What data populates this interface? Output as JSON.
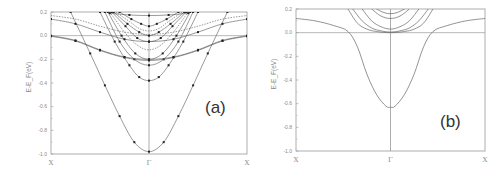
{
  "chart_data": [
    {
      "type": "line",
      "panel_label": "(a)",
      "title": "",
      "ylabel": "E-E_F(eV)",
      "xlabel": "",
      "x_ticks": [
        "X",
        "Γ",
        "X"
      ],
      "y_ticks": [
        "0.2",
        "0.0",
        "-0.2",
        "-0.4",
        "-0.6",
        "-0.8",
        "-1.0"
      ],
      "ylim": [
        -1.0,
        0.2
      ],
      "xlim": [
        -1,
        1
      ],
      "markers": true,
      "fermi_line": 0.0,
      "frame_px": {
        "x0": 51,
        "x1": 247,
        "yTop": 12,
        "yBot": 154
      },
      "series": [
        {
          "name": "deep parabola",
          "style": "markers",
          "x": [
            -0.8,
            -0.6,
            -0.45,
            -0.3,
            -0.15,
            0,
            0.15,
            0.3,
            0.45,
            0.6,
            0.8
          ],
          "y": [
            0.2,
            -0.15,
            -0.42,
            -0.68,
            -0.9,
            -0.98,
            -0.9,
            -0.68,
            -0.42,
            -0.15,
            0.2
          ]
        },
        {
          "name": "parabola -0.38",
          "style": "markers",
          "x": [
            -0.5,
            -0.35,
            -0.2,
            -0.1,
            0,
            0.1,
            0.2,
            0.35,
            0.5
          ],
          "y": [
            0.2,
            -0.05,
            -0.25,
            -0.35,
            -0.38,
            -0.35,
            -0.25,
            -0.05,
            0.2
          ]
        },
        {
          "name": "parabola -0.25",
          "style": "markers",
          "x": [
            -0.45,
            -0.3,
            -0.15,
            0,
            0.15,
            0.3,
            0.45
          ],
          "y": [
            0.2,
            -0.05,
            -0.2,
            -0.25,
            -0.2,
            -0.05,
            0.2
          ]
        },
        {
          "name": "parabola -0.2",
          "style": "markers",
          "x": [
            -0.42,
            -0.28,
            -0.14,
            0,
            0.14,
            0.28,
            0.42
          ],
          "y": [
            0.2,
            0.0,
            -0.15,
            -0.2,
            -0.15,
            0.0,
            0.2
          ]
        },
        {
          "name": "parabola -0.12",
          "style": "dashed",
          "x": [
            -0.4,
            -0.25,
            -0.12,
            0,
            0.12,
            0.25,
            0.4
          ],
          "y": [
            0.2,
            0.03,
            -0.08,
            -0.12,
            -0.08,
            0.03,
            0.2
          ]
        },
        {
          "name": "parabola -0.05",
          "style": "markers",
          "x": [
            -0.38,
            -0.24,
            -0.12,
            0,
            0.12,
            0.24,
            0.38
          ],
          "y": [
            0.2,
            0.08,
            -0.02,
            -0.05,
            -0.02,
            0.08,
            0.2
          ]
        },
        {
          "name": "parabola 0.0",
          "style": "markers",
          "x": [
            -0.36,
            -0.22,
            -0.1,
            0,
            0.1,
            0.22,
            0.36
          ],
          "y": [
            0.2,
            0.1,
            0.03,
            0.0,
            0.03,
            0.1,
            0.2
          ]
        },
        {
          "name": "parabola 0.04",
          "style": "dashed",
          "x": [
            -0.34,
            -0.2,
            -0.1,
            0,
            0.1,
            0.2,
            0.34
          ],
          "y": [
            0.2,
            0.12,
            0.06,
            0.04,
            0.06,
            0.12,
            0.2
          ]
        },
        {
          "name": "parabola 0.08",
          "style": "markers",
          "x": [
            -0.3,
            -0.18,
            -0.08,
            0,
            0.08,
            0.18,
            0.3
          ],
          "y": [
            0.2,
            0.14,
            0.1,
            0.08,
            0.1,
            0.14,
            0.2
          ]
        },
        {
          "name": "flat 0.17",
          "style": "markers",
          "x": [
            -0.4,
            -0.2,
            0,
            0.2,
            0.4
          ],
          "y": [
            0.19,
            0.175,
            0.17,
            0.175,
            0.19
          ]
        },
        {
          "name": "wide band 0.0",
          "style": "markers",
          "x": [
            -1,
            -0.75,
            -0.5,
            -0.25,
            0,
            0.25,
            0.5,
            0.75,
            1
          ],
          "y": [
            0.0,
            -0.04,
            -0.12,
            -0.18,
            -0.2,
            -0.18,
            -0.12,
            -0.04,
            0.0
          ]
        },
        {
          "name": "wide band 0.0b",
          "style": "markers",
          "x": [
            -1,
            -0.75,
            -0.5,
            -0.25,
            0,
            0.25,
            0.5,
            0.75,
            1
          ],
          "y": [
            -0.005,
            -0.045,
            -0.125,
            -0.185,
            -0.21,
            -0.185,
            -0.125,
            -0.045,
            -0.005
          ]
        },
        {
          "name": "wide band 0.14",
          "style": "markers",
          "x": [
            -1,
            -0.75,
            -0.5,
            -0.25,
            0,
            0.25,
            0.5,
            0.75,
            1
          ],
          "y": [
            0.14,
            0.1,
            0.03,
            -0.03,
            -0.05,
            -0.03,
            0.03,
            0.1,
            0.14
          ]
        },
        {
          "name": "wide band 0.17",
          "style": "dashed",
          "x": [
            -1,
            -0.75,
            -0.5,
            -0.25,
            0,
            0.25,
            0.5,
            0.75,
            1
          ],
          "y": [
            0.17,
            0.14,
            0.08,
            0.03,
            0.01,
            0.03,
            0.08,
            0.14,
            0.17
          ]
        }
      ]
    },
    {
      "type": "line",
      "panel_label": "(b)",
      "title": "",
      "ylabel": "E-E_F(eV)",
      "xlabel": "",
      "x_ticks": [
        "X",
        "Γ",
        "X"
      ],
      "y_ticks": [
        "0.2",
        "0.0",
        "-0.2",
        "-0.4",
        "-0.6",
        "-0.8",
        "-1.0"
      ],
      "ylim": [
        -1.0,
        0.2
      ],
      "xlim": [
        -1,
        1
      ],
      "markers": false,
      "fermi_line": 0.0,
      "frame_px": {
        "x0": 296,
        "x1": 485,
        "yTop": 9,
        "yBot": 151
      },
      "series": [
        {
          "name": "main band",
          "style": "line",
          "x": [
            -1,
            -0.8,
            -0.6,
            -0.45,
            -0.35,
            -0.25,
            -0.15,
            -0.05,
            0,
            0.05,
            0.15,
            0.25,
            0.35,
            0.45,
            0.6,
            0.8,
            1
          ],
          "y": [
            0.12,
            0.1,
            0.06,
            0.01,
            -0.12,
            -0.35,
            -0.52,
            -0.62,
            -0.63,
            -0.62,
            -0.52,
            -0.35,
            -0.12,
            0.01,
            0.06,
            0.1,
            0.12
          ]
        },
        {
          "name": "upper band 1",
          "style": "line",
          "x": [
            -0.45,
            -0.35,
            -0.25,
            -0.15,
            0,
            0.15,
            0.25,
            0.35,
            0.45
          ],
          "y": [
            0.2,
            0.08,
            0.03,
            0.01,
            0.0,
            0.01,
            0.03,
            0.08,
            0.2
          ]
        },
        {
          "name": "upper band 2",
          "style": "line",
          "x": [
            -0.4,
            -0.3,
            -0.2,
            -0.1,
            0,
            0.1,
            0.2,
            0.3,
            0.4
          ],
          "y": [
            0.2,
            0.1,
            0.04,
            0.015,
            0.005,
            0.015,
            0.04,
            0.1,
            0.2
          ]
        },
        {
          "name": "upper band 3",
          "style": "line",
          "x": [
            -0.3,
            -0.2,
            -0.1,
            0,
            0.1,
            0.2,
            0.3
          ],
          "y": [
            0.2,
            0.1,
            0.05,
            0.03,
            0.05,
            0.1,
            0.2
          ]
        },
        {
          "name": "upper band 4",
          "style": "line",
          "x": [
            -0.2,
            -0.1,
            0,
            0.1,
            0.2
          ],
          "y": [
            0.2,
            0.14,
            0.12,
            0.14,
            0.2
          ]
        },
        {
          "name": "upper band 5",
          "style": "line",
          "x": [
            -0.15,
            -0.07,
            0,
            0.07,
            0.15
          ],
          "y": [
            0.2,
            0.17,
            0.16,
            0.17,
            0.2
          ]
        }
      ]
    }
  ]
}
